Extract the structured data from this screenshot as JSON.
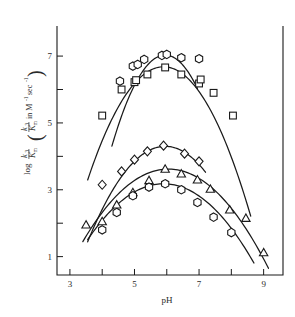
{
  "figure": {
    "background_color": "#ffffff",
    "ink_color": "#1a1a1a"
  },
  "axes": {
    "x_title": "pH",
    "y_title_main": "log",
    "y_title_num": "k",
    "y_title_num_sub": "3",
    "y_title_den": "K",
    "y_title_den_sub": "m",
    "y_title_den_prime": "'",
    "y_paren_open": "(",
    "y_paren_close": ")",
    "y_paren_in": "in M",
    "y_paren_exp1": "-1",
    "y_paren_sec": "sec",
    "y_paren_exp2": "-1"
  },
  "chart_data": {
    "type": "scatter",
    "title": "",
    "xlabel": "pH",
    "ylabel": "log k3/K'm  (k3/K'm in M-1 sec-1)",
    "xlim": [
      2.6,
      9.6
    ],
    "ylim": [
      0.45,
      7.9
    ],
    "xticks": [
      3,
      4,
      5,
      6,
      7,
      8,
      9
    ],
    "xtick_labels": [
      "3",
      "",
      "5",
      "",
      "7",
      "",
      "9"
    ],
    "yticks": [
      1,
      2,
      3,
      4,
      5,
      6,
      7
    ],
    "ytick_labels": [
      "1",
      "",
      "3",
      "",
      "5",
      "",
      "7"
    ],
    "grid": false,
    "legend": "none",
    "series": [
      {
        "name": "curve-1-circles",
        "marker": "hexagon",
        "points": [
          {
            "x": 4.55,
            "y": 6.25
          },
          {
            "x": 4.95,
            "y": 6.7
          },
          {
            "x": 5.1,
            "y": 6.75
          },
          {
            "x": 5.3,
            "y": 6.9
          },
          {
            "x": 5.85,
            "y": 7.02
          },
          {
            "x": 6.0,
            "y": 7.05
          },
          {
            "x": 6.45,
            "y": 6.95
          },
          {
            "x": 7.0,
            "y": 6.92
          }
        ],
        "fit_curve": {
          "peak_x": 5.95,
          "peak_y": 7.03,
          "width": 2.05,
          "x_start": 4.3,
          "x_end": 6.95
        }
      },
      {
        "name": "curve-2-squares",
        "marker": "square",
        "points": [
          {
            "x": 4.0,
            "y": 5.22
          },
          {
            "x": 4.6,
            "y": 6.0
          },
          {
            "x": 5.0,
            "y": 6.22
          },
          {
            "x": 5.05,
            "y": 6.28
          },
          {
            "x": 5.4,
            "y": 6.45
          },
          {
            "x": 5.95,
            "y": 6.66
          },
          {
            "x": 6.45,
            "y": 6.45
          },
          {
            "x": 7.0,
            "y": 6.18
          },
          {
            "x": 7.05,
            "y": 6.3
          },
          {
            "x": 7.45,
            "y": 5.9
          },
          {
            "x": 8.05,
            "y": 5.22
          }
        ],
        "fit_curve": {
          "peak_x": 5.9,
          "peak_y": 6.68,
          "width": 2.55,
          "x_start": 3.55,
          "x_end": 8.6
        }
      },
      {
        "name": "curve-3-diamonds",
        "marker": "diamond",
        "points": [
          {
            "x": 4.0,
            "y": 3.15
          },
          {
            "x": 4.6,
            "y": 3.55
          },
          {
            "x": 5.0,
            "y": 3.9
          },
          {
            "x": 5.4,
            "y": 4.15
          },
          {
            "x": 5.9,
            "y": 4.32
          },
          {
            "x": 6.55,
            "y": 4.08
          },
          {
            "x": 7.0,
            "y": 3.85
          }
        ],
        "fit_curve": {
          "peak_x": 5.95,
          "peak_y": 4.3,
          "width": 2.25,
          "x_start": 3.55,
          "x_end": 7.2
        }
      },
      {
        "name": "curve-4-triangles",
        "marker": "triangle",
        "points": [
          {
            "x": 3.5,
            "y": 1.95
          },
          {
            "x": 4.0,
            "y": 2.05
          },
          {
            "x": 4.45,
            "y": 2.55
          },
          {
            "x": 4.95,
            "y": 2.92
          },
          {
            "x": 5.45,
            "y": 3.28
          },
          {
            "x": 5.95,
            "y": 3.62
          },
          {
            "x": 6.45,
            "y": 3.48
          },
          {
            "x": 6.95,
            "y": 3.3
          },
          {
            "x": 7.35,
            "y": 3.02
          },
          {
            "x": 7.95,
            "y": 2.4
          },
          {
            "x": 8.45,
            "y": 2.15
          },
          {
            "x": 9.0,
            "y": 1.12
          }
        ],
        "fit_curve": {
          "peak_x": 6.05,
          "peak_y": 3.62,
          "width": 2.6,
          "x_start": 3.4,
          "x_end": 9.15
        }
      },
      {
        "name": "curve-5-circles-lower",
        "marker": "hexagon",
        "points": [
          {
            "x": 4.0,
            "y": 1.8
          },
          {
            "x": 4.45,
            "y": 2.32
          },
          {
            "x": 4.95,
            "y": 2.82
          },
          {
            "x": 5.45,
            "y": 3.08
          },
          {
            "x": 5.95,
            "y": 3.18
          },
          {
            "x": 6.45,
            "y": 3.0
          },
          {
            "x": 6.95,
            "y": 2.62
          },
          {
            "x": 7.45,
            "y": 2.18
          },
          {
            "x": 8.0,
            "y": 1.72
          }
        ],
        "fit_curve": {
          "peak_x": 5.9,
          "peak_y": 3.18,
          "width": 2.45,
          "x_start": 3.55,
          "x_end": 8.7
        }
      }
    ]
  }
}
